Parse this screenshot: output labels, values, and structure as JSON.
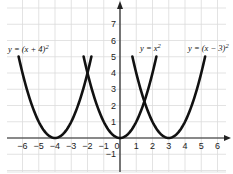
{
  "chart_data": {
    "type": "line",
    "title": "",
    "xlabel": "x",
    "ylabel": "y",
    "xlim": [
      -7,
      6.5
    ],
    "ylim": [
      -2,
      8.5
    ],
    "grid": true,
    "x_ticks": [
      -6,
      -5,
      -4,
      -3,
      -2,
      -1,
      0,
      1,
      2,
      3,
      4,
      5,
      6
    ],
    "y_ticks": [
      -1,
      1,
      2,
      3,
      4,
      5,
      6,
      7
    ],
    "series": [
      {
        "name": "y = (x+4)^2",
        "label": "y = (x + 4)",
        "exponent": "2",
        "h": -4,
        "domain": [
          -6.24,
          -1.76
        ],
        "vertex": [
          -4,
          0
        ]
      },
      {
        "name": "y = x^2",
        "label": "y = x",
        "exponent": "2",
        "h": 0,
        "domain": [
          -2.24,
          2.24
        ],
        "vertex": [
          0,
          0
        ]
      },
      {
        "name": "y = (x-3)^2",
        "label": "y = (x − 3)",
        "exponent": "2",
        "h": 3,
        "domain": [
          0.76,
          5.24
        ],
        "vertex": [
          3,
          0
        ]
      }
    ],
    "colors": {
      "curve": "#111111",
      "axis": "#222222",
      "grid": "#dcdcdc",
      "background": "#ffffff"
    }
  }
}
